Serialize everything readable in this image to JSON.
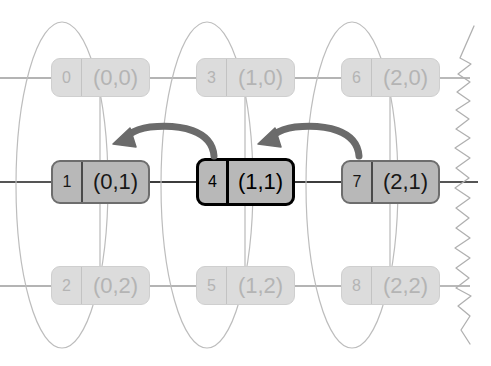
{
  "figure": {
    "canvas": {
      "width": 491,
      "height": 366,
      "background": "#ffffff"
    },
    "palette": {
      "faded_fill": "#dcdcdc",
      "faded_border": "#cfcfcf",
      "faded_text": "#b4b4b4",
      "active_fill": "#b8b8b8",
      "active_border": "#6d6d6d",
      "current_border": "#000000",
      "text_dark": "#171717",
      "edge_line": "#8c8c8c",
      "edge_line_strong": "#555555",
      "arrow": "#6b6b6b",
      "ellipse_stroke": "#bdbdbd",
      "torn_edge": "#b0b0b0"
    },
    "nodes": [
      {
        "id": "0",
        "label": "(0,0)",
        "state": "faded",
        "col": 0,
        "row": 0
      },
      {
        "id": "1",
        "label": "(0,1)",
        "state": "active",
        "col": 0,
        "row": 1
      },
      {
        "id": "2",
        "label": "(0,2)",
        "state": "faded",
        "col": 0,
        "row": 2
      },
      {
        "id": "3",
        "label": "(1,0)",
        "state": "faded",
        "col": 1,
        "row": 0
      },
      {
        "id": "4",
        "label": "(1,1)",
        "state": "current",
        "col": 1,
        "row": 1
      },
      {
        "id": "5",
        "label": "(1,2)",
        "state": "faded",
        "col": 1,
        "row": 2
      },
      {
        "id": "6",
        "label": "(2,0)",
        "state": "faded",
        "col": 2,
        "row": 0
      },
      {
        "id": "7",
        "label": "(2,1)",
        "state": "active",
        "col": 2,
        "row": 1
      },
      {
        "id": "8",
        "label": "(2,2)",
        "state": "faded",
        "col": 2,
        "row": 2
      }
    ],
    "groups": [
      {
        "name": "column-0",
        "center_x": 62,
        "center_y": 185,
        "rx": 46,
        "ry": 163
      },
      {
        "name": "column-1",
        "center_x": 207,
        "center_y": 185,
        "rx": 46,
        "ry": 163
      },
      {
        "name": "column-2",
        "center_x": 352,
        "center_y": 185,
        "rx": 46,
        "ry": 163
      }
    ],
    "arrows": [
      {
        "name": "arrow-4-to-1",
        "from": "4",
        "to": "1",
        "direction": "left"
      },
      {
        "name": "arrow-7-to-4",
        "from": "7",
        "to": "4",
        "direction": "left"
      }
    ],
    "torn_edge": {
      "name": "torn-right-edge",
      "x": 462,
      "visible": true
    }
  }
}
